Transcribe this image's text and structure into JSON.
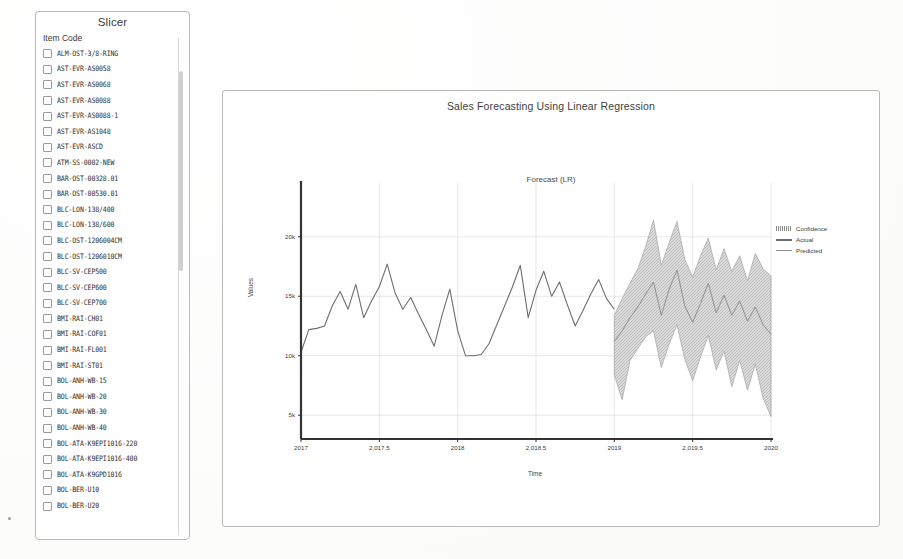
{
  "slicer": {
    "title": "Slicer",
    "field_label": "Item Code",
    "items": [
      {
        "label": "ALM-OST-3/8-RING",
        "checked": false
      },
      {
        "label": "AST-EVR-AS0058",
        "checked": false
      },
      {
        "label": "AST-EVR-AS0068",
        "checked": false
      },
      {
        "label": "AST-EVR-AS0088",
        "checked": false
      },
      {
        "label": "AST-EVR-AS0088-1",
        "checked": false
      },
      {
        "label": "AST-EVR-AS1048",
        "checked": false
      },
      {
        "label": "AST-EVR-ASCD",
        "checked": false
      },
      {
        "label": "ATM-SS-0002-NEW",
        "checked": false
      },
      {
        "label": "BAR-OST-00328.01",
        "checked": false
      },
      {
        "label": "BAR-OST-00530.01",
        "checked": false
      },
      {
        "label": "BLC-LON-138/400",
        "checked": false
      },
      {
        "label": "BLC-LON-138/600",
        "checked": false
      },
      {
        "label": "BLC-OST-1206004CM",
        "checked": false
      },
      {
        "label": "BLC-OST-1206010CM",
        "checked": false
      },
      {
        "label": "BLC-SV-CEP500",
        "checked": false
      },
      {
        "label": "BLC-SV-CEP600",
        "checked": false
      },
      {
        "label": "BLC-SV-CEP700",
        "checked": false
      },
      {
        "label": "BMI-RAI-CH01",
        "checked": false
      },
      {
        "label": "BMI-RAI-COF01",
        "checked": false
      },
      {
        "label": "BMI-RAI-FL001",
        "checked": false
      },
      {
        "label": "BMI-RAI-ST01",
        "checked": false
      },
      {
        "label": "BOL-ANH-WB-15",
        "checked": false
      },
      {
        "label": "BOL-ANH-WB-20",
        "checked": false
      },
      {
        "label": "BOL-ANH-WB-30",
        "checked": false
      },
      {
        "label": "BOL-ANH-WB-40",
        "checked": false
      },
      {
        "label": "BOL-ATA-K9EPI1016-220",
        "checked": false
      },
      {
        "label": "BOL-ATA-K9EPI1016-400",
        "checked": false
      },
      {
        "label": "BOL-ATA-K9GPD1016",
        "checked": false
      },
      {
        "label": "BOL-BER-U10",
        "checked": false
      },
      {
        "label": "BOL-BER-U20",
        "checked": false
      }
    ]
  },
  "chart_header": {
    "title": "Sales Forecasting Using Linear Regression",
    "subtitle": "Forecast (LR)"
  },
  "legend": {
    "confidence": "Confidence",
    "actual": "Actual",
    "predicted": "Predicted"
  },
  "chart_data": {
    "type": "line",
    "title": "Sales Forecasting Using Linear Regression",
    "subtitle": "Forecast (LR)",
    "xlabel": "Time",
    "ylabel": "Values",
    "xlim": [
      2017,
      2020
    ],
    "ylim": [
      3000,
      22000
    ],
    "grid": true,
    "legend_position": "right",
    "xticks": [
      2017,
      2017.5,
      2018,
      2018.5,
      2019,
      2019.5,
      2020
    ],
    "xticklabels": [
      "2017",
      "2,017.5",
      "2018",
      "2,018.5",
      "2019",
      "2,019.5",
      "2020"
    ],
    "yticks": [
      5000,
      10000,
      15000,
      20000
    ],
    "yticklabels": [
      "5k",
      "10k",
      "15k",
      "20k"
    ],
    "colors": {
      "actual": "#6e6e6e",
      "predicted": "#8f8f8f",
      "confidence": "#bdbdbd",
      "axis": "#333333",
      "grid": "#d7d7d7"
    },
    "series": [
      {
        "name": "Actual",
        "x": [
          2017.0,
          2017.05,
          2017.1,
          2017.15,
          2017.2,
          2017.25,
          2017.3,
          2017.35,
          2017.4,
          2017.45,
          2017.5,
          2017.55,
          2017.6,
          2017.65,
          2017.7,
          2017.75,
          2017.8,
          2017.85,
          2017.9,
          2017.95,
          2018.0,
          2018.05,
          2018.1,
          2018.15,
          2018.2,
          2018.25,
          2018.3,
          2018.35,
          2018.4,
          2018.45,
          2018.5,
          2018.55,
          2018.6,
          2018.65,
          2018.7,
          2018.75,
          2018.8,
          2018.85,
          2018.9,
          2018.95,
          2019.0
        ],
        "values": [
          10300,
          12200,
          12300,
          12500,
          14200,
          15400,
          13900,
          16000,
          13200,
          14600,
          15800,
          17700,
          15300,
          13900,
          14900,
          13500,
          12200,
          10800,
          13400,
          15600,
          12100,
          10000,
          10000,
          10100,
          11000,
          12600,
          14200,
          15800,
          17600,
          13200,
          15500,
          17100,
          15000,
          16200,
          14300,
          12500,
          13800,
          15200,
          16400,
          14800,
          13900
        ]
      },
      {
        "name": "Predicted",
        "x": [
          2019.0,
          2019.05,
          2019.1,
          2019.15,
          2019.2,
          2019.25,
          2019.3,
          2019.35,
          2019.4,
          2019.45,
          2019.5,
          2019.55,
          2019.6,
          2019.65,
          2019.7,
          2019.75,
          2019.8,
          2019.85,
          2019.9,
          2019.95,
          2020.0
        ],
        "values": [
          11200,
          12100,
          13200,
          14100,
          15200,
          16200,
          13400,
          15600,
          17200,
          14200,
          12800,
          14400,
          16100,
          13600,
          15100,
          13400,
          14600,
          12900,
          14100,
          12600,
          11800
        ]
      },
      {
        "name": "Confidence",
        "x": [
          2019.0,
          2019.05,
          2019.1,
          2019.15,
          2019.2,
          2019.25,
          2019.3,
          2019.35,
          2019.4,
          2019.45,
          2019.5,
          2019.55,
          2019.6,
          2019.65,
          2019.7,
          2019.75,
          2019.8,
          2019.85,
          2019.9,
          2019.95,
          2020.0
        ],
        "upper": [
          13400,
          14800,
          16100,
          17300,
          19200,
          21400,
          17600,
          19500,
          21300,
          18100,
          16600,
          18400,
          19900,
          17200,
          19000,
          17100,
          18400,
          16300,
          18600,
          17300,
          16700
        ],
        "lower": [
          8400,
          6300,
          9600,
          10600,
          11600,
          12100,
          9000,
          11000,
          12600,
          9700,
          7900,
          9900,
          11700,
          8800,
          10400,
          7400,
          9600,
          7100,
          9300,
          6400,
          4900
        ]
      }
    ]
  }
}
